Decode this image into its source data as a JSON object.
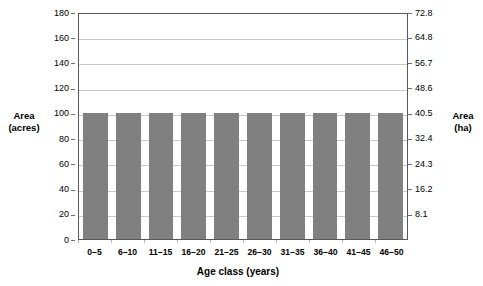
{
  "chart_data": {
    "type": "bar",
    "title": "",
    "subtitle": "",
    "xlabel": "Age class (years)",
    "ylabel": "Area (acres)",
    "ylabel_secondary": "Area (ha)",
    "categories": [
      "0–5",
      "6–10",
      "11–15",
      "16–20",
      "21–25",
      "26–30",
      "31–35",
      "36–40",
      "41–45",
      "46–50"
    ],
    "values": [
      100,
      100,
      100,
      100,
      100,
      100,
      100,
      100,
      100,
      100
    ],
    "series": [
      {
        "name": "Area",
        "values": [
          100,
          100,
          100,
          100,
          100,
          100,
          100,
          100,
          100,
          100
        ]
      }
    ],
    "ylim": [
      0,
      180
    ],
    "ytick_labels": [
      "180",
      "160",
      "140",
      "120",
      "100",
      "80",
      "60",
      "40",
      "20",
      "0"
    ],
    "ytick_values": [
      180,
      160,
      140,
      120,
      100,
      80,
      60,
      40,
      20,
      0
    ],
    "ylim_secondary": [
      0,
      72.8
    ],
    "ytick_labels_secondary": [
      "72.8",
      "64.8",
      "56.7",
      "48.6",
      "40.5",
      "32.4",
      "24.3",
      "16.2",
      "8.1"
    ],
    "ytick_values_secondary": [
      72.8,
      64.8,
      56.7,
      48.6,
      40.5,
      32.4,
      24.3,
      16.2,
      8.1
    ],
    "grid": "horizontal",
    "legend": "none",
    "bar_color": "#808080",
    "gridline_color": "#c9c9c9",
    "axis_color": "#58585a",
    "background_color": "#ffffff"
  },
  "axes": {
    "left_title_line1": "Area",
    "left_title_line2": "(acres)",
    "right_title_line1": "Area",
    "right_title_line2": "(ha)",
    "x_title": "Age class (years)"
  }
}
